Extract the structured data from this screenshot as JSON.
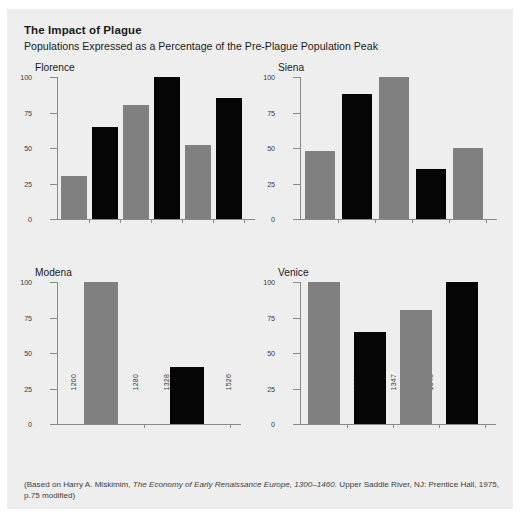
{
  "figure": {
    "title": "The Impact of Plague",
    "subtitle": "Populations Expressed as a Percentage of the Pre-Plague Population Peak",
    "source_line1_a": "(Based on Harry A. Miskimim, ",
    "source_line1_b": "The Economy of Early Renaissance Europe, 1300–1460.",
    "source_line1_c": " Upper Saddle River, NJ: Prentice Hall,",
    "source_line2": "1975, p.75 modified)",
    "colors": {
      "panel_background": "#eeeeee",
      "page_background": "#ffffff",
      "bar_gray": "#808080",
      "bar_black": "#050505",
      "axis": "#8a8a8a",
      "text": "#1a1a1a"
    }
  },
  "chart_data": [
    {
      "type": "bar",
      "title": "Florence",
      "xlabel": "",
      "ylabel": "",
      "ylim": [
        0,
        100
      ],
      "yticks": [
        0,
        25,
        50,
        75,
        100
      ],
      "ytick_labels": [
        "0",
        "25",
        "50",
        "75",
        "100"
      ],
      "grid": false,
      "legend": "none",
      "categories": [
        "1200",
        "1240",
        "1280",
        "1328",
        "1351",
        "1526"
      ],
      "values": [
        30,
        65,
        80,
        100,
        52,
        85
      ],
      "bar_colors": [
        "gray",
        "black",
        "gray",
        "black",
        "gray",
        "black"
      ]
    },
    {
      "type": "bar",
      "title": "Siena",
      "xlabel": "",
      "ylabel": "",
      "ylim": [
        0,
        100
      ],
      "yticks": [
        0,
        25,
        50,
        75,
        100
      ],
      "ytick_labels": [
        "0",
        "25",
        "50",
        "75",
        "100"
      ],
      "grid": false,
      "legend": "none",
      "categories": [
        "1250",
        "1328",
        "1347",
        "1348",
        "1520"
      ],
      "values": [
        48,
        88,
        100,
        35,
        50
      ],
      "bar_colors": [
        "gray",
        "black",
        "gray",
        "black",
        "gray"
      ]
    },
    {
      "type": "bar",
      "title": "Modena",
      "xlabel": "",
      "ylabel": "",
      "ylim": [
        0,
        100
      ],
      "yticks": [
        0,
        25,
        50,
        75,
        100
      ],
      "ytick_labels": [
        "0",
        "25",
        "50",
        "75",
        "100"
      ],
      "grid": false,
      "legend": "none",
      "categories": [
        "1306",
        "1482"
      ],
      "values": [
        100,
        40
      ],
      "bar_colors": [
        "gray",
        "black"
      ]
    },
    {
      "type": "bar",
      "title": "Venice",
      "xlabel": "",
      "ylabel": "",
      "ylim": [
        0,
        100
      ],
      "yticks": [
        0,
        25,
        50,
        75,
        100
      ],
      "ytick_labels": [
        "0",
        "25",
        "50",
        "75",
        "100"
      ],
      "grid": false,
      "legend": "none",
      "categories": [
        "1338",
        "1352",
        "1442",
        "1509"
      ],
      "values": [
        100,
        65,
        80,
        100
      ],
      "bar_colors": [
        "gray",
        "black",
        "gray",
        "black"
      ]
    }
  ]
}
